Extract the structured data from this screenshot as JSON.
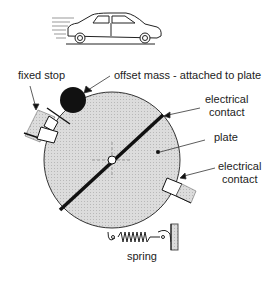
{
  "labels": {
    "fixed_stop": "fixed stop",
    "offset_mass": "offset mass - attached to plate",
    "electrical_contact_top_1": "electrical",
    "electrical_contact_top_2": "contact",
    "plate": "plate",
    "electrical_contact_bottom_1": "electrical",
    "electrical_contact_bottom_2": "contact",
    "spring": "spring"
  },
  "colors": {
    "plate_fill": "#d6d6d6",
    "stroke": "#222222",
    "mass": "#111111",
    "stop_fill": "#c8c8c8"
  }
}
